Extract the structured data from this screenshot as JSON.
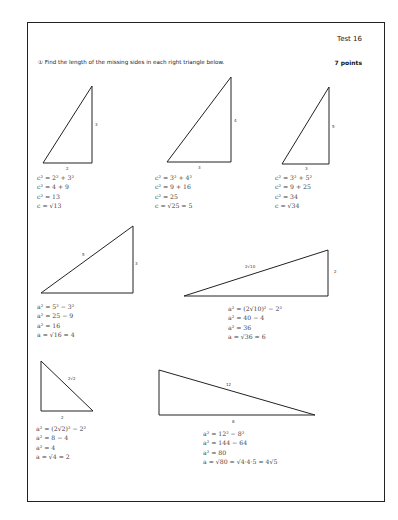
{
  "header": {
    "title": "Test 16",
    "instruction": "① Find the length of the missing sides in each right triangle below.",
    "points": "7 points"
  },
  "problems": [
    {
      "labels": {
        "a": "2",
        "b": "3"
      },
      "work": [
        "c² = 2² + 3²",
        "c² = 4 + 9",
        "c² = 13",
        "c = √13"
      ]
    },
    {
      "labels": {
        "a": "3",
        "b": "4"
      },
      "work": [
        "c² = 3² + 4²",
        "c² = 9 + 16",
        "c² = 25",
        "c = √25 = 5"
      ]
    },
    {
      "labels": {
        "a": "3",
        "b": "5"
      },
      "work": [
        "c² = 3² + 5²",
        "c² = 9 + 25",
        "c² = 34",
        "c = √34"
      ]
    },
    {
      "labels": {
        "c": "5",
        "b": "3"
      },
      "work": [
        "a² = 5² − 3²",
        "a² = 25 − 9",
        "a² = 16",
        "a = √16 = 4"
      ]
    },
    {
      "labels": {
        "c": "2√10",
        "b": "2"
      },
      "work": [
        "a² = (2√10)² − 2²",
        "a² = 40 − 4",
        "a² = 36",
        "a = √36 = 6"
      ]
    },
    {
      "labels": {
        "c": "2√2",
        "a": "2"
      },
      "work": [
        "a² = (2√2)² − 2²",
        "a² = 8 − 4",
        "a² = 4",
        "a = √4 = 2"
      ]
    },
    {
      "labels": {
        "c": "12",
        "a": "8"
      },
      "work": [
        "a² = 12² − 8²",
        "a² = 144 − 64",
        "a² = 80",
        "a = √80 = √4·4·5 = 4√5"
      ]
    }
  ]
}
